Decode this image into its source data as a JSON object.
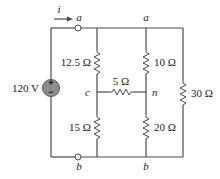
{
  "diagram": {
    "type": "circuit-schematic",
    "current": {
      "label": "i",
      "direction": "right"
    },
    "source": {
      "label": "120 V",
      "plus": "+",
      "minus": "−",
      "color": "#8c8c8c"
    },
    "nodes": {
      "a_terminal": "a",
      "a_top": "a",
      "b_terminal": "b",
      "b_bottom": "b",
      "c": "c",
      "n": "n"
    },
    "resistors": [
      {
        "id": "r1",
        "label": "12.5 Ω",
        "between": [
          "a",
          "c"
        ]
      },
      {
        "id": "r2",
        "label": "10 Ω",
        "between": [
          "a",
          "n"
        ]
      },
      {
        "id": "r3",
        "label": "5 Ω",
        "between": [
          "c",
          "n"
        ]
      },
      {
        "id": "r4",
        "label": "15 Ω",
        "between": [
          "c",
          "b"
        ]
      },
      {
        "id": "r5",
        "label": "20 Ω",
        "between": [
          "n",
          "b"
        ]
      },
      {
        "id": "r6",
        "label": "30 Ω",
        "between": [
          "a",
          "b"
        ]
      }
    ]
  }
}
